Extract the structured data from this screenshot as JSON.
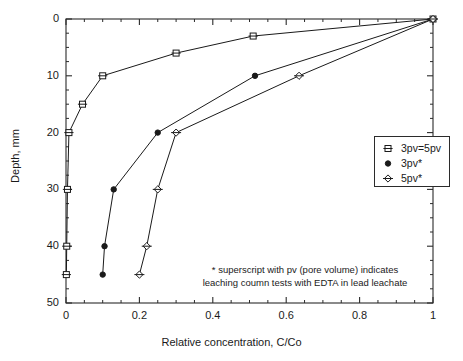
{
  "chart_data": {
    "type": "line",
    "title": "",
    "xlabel": "Relative concentration, C/Co",
    "ylabel": "Depth, mm",
    "xlim": [
      0,
      1
    ],
    "ylim": [
      0,
      50
    ],
    "y_inverted": true,
    "grid": false,
    "xticks": [
      "0",
      "0.2",
      "0.4",
      "0.6",
      "0.8",
      "1"
    ],
    "xtick_values": [
      0,
      0.2,
      0.4,
      0.6,
      0.8,
      1
    ],
    "x_minor_ticks": [
      0.05,
      0.1,
      0.15,
      0.25,
      0.3,
      0.35,
      0.45,
      0.5,
      0.55,
      0.65,
      0.7,
      0.75,
      0.85,
      0.9,
      0.95
    ],
    "yticks": [
      "0",
      "10",
      "20",
      "30",
      "40",
      "50"
    ],
    "ytick_values": [
      0,
      10,
      20,
      30,
      40,
      50
    ],
    "y_minor_ticks": [
      2.5,
      5,
      7.5,
      12.5,
      15,
      17.5,
      22.5,
      25,
      27.5,
      32.5,
      35,
      37.5,
      42.5,
      45,
      47.5
    ],
    "legend_position": "right-middle",
    "series": [
      {
        "name": "3pv=5pv",
        "marker": "open-square",
        "color": "#1a1a1a",
        "points": [
          {
            "x": 1.0,
            "y": 0
          },
          {
            "x": 0.51,
            "y": 3
          },
          {
            "x": 0.3,
            "y": 6
          },
          {
            "x": 0.1,
            "y": 10
          },
          {
            "x": 0.045,
            "y": 15
          },
          {
            "x": 0.008,
            "y": 20
          },
          {
            "x": 0.004,
            "y": 30
          },
          {
            "x": 0.002,
            "y": 40
          },
          {
            "x": 0.001,
            "y": 45
          }
        ]
      },
      {
        "name": "3pv*",
        "marker": "filled-circle",
        "color": "#1a1a1a",
        "points": [
          {
            "x": 1.0,
            "y": 0
          },
          {
            "x": 0.515,
            "y": 10
          },
          {
            "x": 0.25,
            "y": 20
          },
          {
            "x": 0.13,
            "y": 30
          },
          {
            "x": 0.105,
            "y": 40
          },
          {
            "x": 0.1,
            "y": 45
          }
        ]
      },
      {
        "name": "5pv*",
        "marker": "open-diamond",
        "color": "#1a1a1a",
        "points": [
          {
            "x": 1.0,
            "y": 0
          },
          {
            "x": 0.635,
            "y": 10
          },
          {
            "x": 0.3,
            "y": 20
          },
          {
            "x": 0.25,
            "y": 30
          },
          {
            "x": 0.22,
            "y": 40
          },
          {
            "x": 0.2,
            "y": 45
          }
        ]
      }
    ],
    "annotations": [
      "* superscript with pv (pore volume) indicates",
      "leaching coumn tests with EDTA in lead leachate"
    ]
  },
  "legend": {
    "items": [
      {
        "label": "3pv=5pv",
        "marker": "open-square"
      },
      {
        "label": "3pv*",
        "marker": "filled-circle"
      },
      {
        "label": "5pv*",
        "marker": "open-diamond"
      }
    ]
  },
  "axes": {
    "x_title": "Relative concentration, C/Co",
    "y_title": "Depth, mm"
  },
  "notes": {
    "line1": "* superscript with pv (pore volume) indicates",
    "line2": "leaching coumn tests with EDTA in lead leachate"
  },
  "colors": {
    "line": "#1a1a1a",
    "axis": "#2b2b2b",
    "background": "#ffffff",
    "marker_fill": "#ffffff"
  }
}
